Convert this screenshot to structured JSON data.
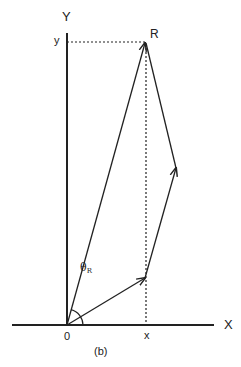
{
  "diagram": {
    "caption": "(b)",
    "axes": {
      "x_axis_label": "X",
      "y_axis_label": "Y",
      "origin_label": "0",
      "x_projection_label": "x",
      "y_projection_label": "y"
    },
    "resultant": {
      "label": "R",
      "angle_symbol": "θ",
      "angle_subscript": "R"
    },
    "vectors": [
      {
        "from": "O",
        "to": "A",
        "description": "first vector from origin"
      },
      {
        "from": "A",
        "to": "B",
        "description": "second vector"
      },
      {
        "from": "B",
        "to": "R",
        "description": "third vector"
      },
      {
        "from": "O",
        "to": "R",
        "description": "resultant vector R"
      }
    ],
    "colors": {
      "line": "#222222",
      "background": "#ffffff"
    }
  }
}
